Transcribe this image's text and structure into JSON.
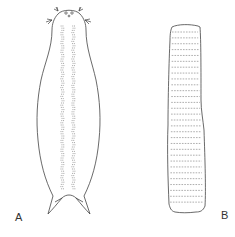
{
  "figure": {
    "panels": [
      {
        "id": "A",
        "label": "A",
        "description": "Dorsal outline of elongated organism with paired dotted internal columns, anterior tentacle tufts and forked posterior tail"
      },
      {
        "id": "B",
        "label": "B",
        "description": "Elongated cylindrical body with transverse dashed segment bands",
        "band_count": 30
      }
    ],
    "colors": {
      "stroke": "#444444",
      "background": "#ffffff"
    }
  }
}
